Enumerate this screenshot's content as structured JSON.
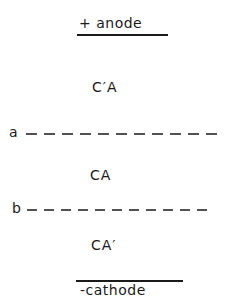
{
  "diagram": {
    "type": "electrophoresis-zone-schematic",
    "anode": {
      "label": "+ anode"
    },
    "cathode": {
      "label": "-cathode"
    },
    "zones": [
      {
        "id": "upper",
        "label": "C′A"
      },
      {
        "id": "middle",
        "label": "CA"
      },
      {
        "id": "lower",
        "label": "CA′"
      }
    ],
    "boundaries": [
      {
        "id": "a",
        "label": "a",
        "style": "dashed"
      },
      {
        "id": "b",
        "label": "b",
        "style": "dashed"
      }
    ],
    "colors": {
      "ink": "#1a1a1a",
      "background": "#ffffff"
    }
  }
}
